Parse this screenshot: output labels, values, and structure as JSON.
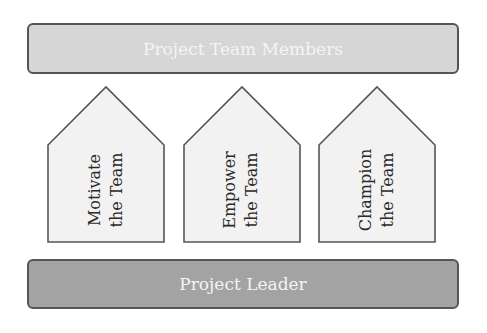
{
  "diagram": {
    "top_bar": {
      "label": "Project Team Members",
      "fill": "#d6d6d6"
    },
    "bottom_bar": {
      "label": "Project Leader",
      "fill": "#a3a3a3"
    },
    "houses": [
      {
        "line1": "Motivate",
        "line2": "the Team"
      },
      {
        "line1": "Empower",
        "line2": "the Team"
      },
      {
        "line1": "Champion",
        "line2": "the Team"
      }
    ],
    "colors": {
      "outline": "#555555",
      "house_fill": "#f2f2f2",
      "text_dark": "#2a2a2a",
      "text_light": "#f4f4f4"
    }
  }
}
